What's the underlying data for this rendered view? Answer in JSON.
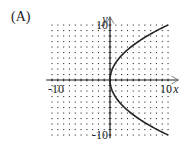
{
  "panel_label": "(A)",
  "chart_data": {
    "type": "line",
    "title": "",
    "panel": "(A)",
    "xlabel": "x",
    "ylabel": "y",
    "xlim": [
      -10,
      10
    ],
    "ylim": [
      -10,
      10
    ],
    "grid": "dotted",
    "tick_labels": {
      "x": [
        "-10",
        "10"
      ],
      "y": [
        "10",
        "-10"
      ]
    },
    "series": [
      {
        "name": "x = y^2/10",
        "equation": "x = y^2 / 10",
        "points": [
          {
            "x": 10,
            "y": -10
          },
          {
            "x": 6.4,
            "y": -8
          },
          {
            "x": 3.6,
            "y": -6
          },
          {
            "x": 1.6,
            "y": -4
          },
          {
            "x": 0.4,
            "y": -2
          },
          {
            "x": 0,
            "y": 0
          },
          {
            "x": 0.4,
            "y": 2
          },
          {
            "x": 1.6,
            "y": 4
          },
          {
            "x": 3.6,
            "y": 6
          },
          {
            "x": 6.4,
            "y": 8
          },
          {
            "x": 10,
            "y": 10
          }
        ]
      }
    ],
    "legend": "none"
  },
  "colors": {
    "ink": "#222222",
    "grid_dot": "#333333",
    "background": "#ffffff"
  }
}
